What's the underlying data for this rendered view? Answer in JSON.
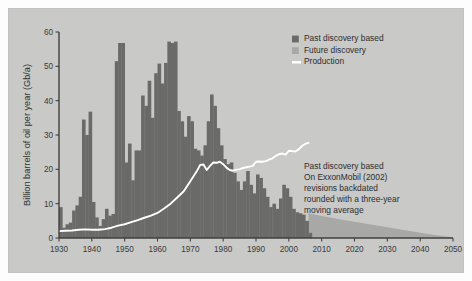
{
  "figure": {
    "panel_background": "#c9c9c7",
    "outer_background": "#fdfdfd"
  },
  "chart_data": {
    "type": "bar",
    "title": "",
    "xlabel": "",
    "ylabel": "Billion barrels of oil per year (Gb/a)",
    "xlim": [
      1930,
      2050
    ],
    "ylim": [
      0,
      60
    ],
    "grid": false,
    "legend_position": "top-right",
    "x_ticks": [
      1930,
      1940,
      1950,
      1960,
      1970,
      1980,
      1990,
      2000,
      2010,
      2020,
      2030,
      2040,
      2050
    ],
    "y_ticks": [
      0,
      10,
      20,
      30,
      40,
      50,
      60
    ],
    "colors": {
      "past_discovery": "#6a6a68",
      "future_discovery": "#a8a8a6",
      "production": "#ffffff"
    },
    "legend": [
      {
        "label": "Past discovery based",
        "color": "#6a6a68",
        "marker": "square"
      },
      {
        "label": "Future discovery",
        "color": "#a8a8a6",
        "marker": "square"
      },
      {
        "label": "Production",
        "color": "#ffffff",
        "marker": "line"
      }
    ],
    "annotation": {
      "lines": [
        "Past discovery based",
        "On ExxonMobil (2002)",
        "revisions backdated",
        "rounded with a three-year",
        "moving average"
      ]
    },
    "series": [
      {
        "name": "Past discovery based",
        "type": "bar",
        "x": [
          1930,
          1931,
          1932,
          1933,
          1934,
          1935,
          1936,
          1937,
          1938,
          1939,
          1940,
          1941,
          1942,
          1943,
          1944,
          1945,
          1946,
          1947,
          1948,
          1949,
          1950,
          1951,
          1952,
          1953,
          1954,
          1955,
          1956,
          1957,
          1958,
          1959,
          1960,
          1961,
          1962,
          1963,
          1964,
          1965,
          1966,
          1967,
          1968,
          1969,
          1970,
          1971,
          1972,
          1973,
          1974,
          1975,
          1976,
          1977,
          1978,
          1979,
          1980,
          1981,
          1982,
          1983,
          1984,
          1985,
          1986,
          1987,
          1988,
          1989,
          1990,
          1991,
          1992,
          1993,
          1994,
          1995,
          1996,
          1997,
          1998,
          1999,
          2000,
          2001,
          2002,
          2003,
          2004,
          2005,
          2006
        ],
        "values": [
          9.0,
          3.0,
          4.0,
          4.5,
          8.0,
          9.5,
          12.0,
          34.5,
          30.0,
          36.8,
          10.5,
          6.0,
          3.5,
          5.5,
          8.5,
          6.5,
          7.0,
          51.5,
          56.8,
          56.8,
          22.0,
          27.5,
          16.8,
          25.5,
          25.5,
          41.5,
          38.5,
          45.8,
          35.0,
          48.0,
          50.8,
          45.0,
          51.0,
          57.2,
          56.8,
          57.2,
          37.0,
          34.0,
          29.5,
          35.5,
          34.0,
          26.0,
          25.5,
          24.0,
          27.0,
          34.0,
          41.8,
          38.5,
          32.0,
          27.0,
          23.0,
          21.5,
          22.0,
          19.0,
          16.5,
          14.0,
          16.5,
          19.5,
          15.5,
          13.0,
          18.5,
          17.5,
          14.5,
          12.0,
          9.0,
          10.0,
          8.5,
          11.5,
          15.5,
          14.5,
          12.0,
          8.5,
          7.5,
          7.2,
          6.8,
          5.0,
          1.5
        ]
      },
      {
        "name": "Future discovery",
        "type": "area",
        "x": [
          2006,
          2010,
          2015,
          2020,
          2025,
          2030,
          2035,
          2040,
          2045,
          2050
        ],
        "values": [
          7.2,
          6.4,
          5.5,
          4.7,
          3.9,
          3.1,
          2.3,
          1.5,
          0.8,
          0.2
        ]
      },
      {
        "name": "Production",
        "type": "line",
        "x": [
          1930,
          1932,
          1934,
          1936,
          1938,
          1940,
          1942,
          1944,
          1946,
          1948,
          1950,
          1952,
          1954,
          1956,
          1958,
          1960,
          1962,
          1964,
          1966,
          1968,
          1970,
          1972,
          1973,
          1974,
          1975,
          1976,
          1977,
          1978,
          1979,
          1980,
          1981,
          1982,
          1983,
          1984,
          1985,
          1986,
          1987,
          1988,
          1989,
          1990,
          1991,
          1992,
          1993,
          1994,
          1995,
          1996,
          1997,
          1998,
          1999,
          2000,
          2001,
          2002,
          2003,
          2004,
          2005,
          2006
        ],
        "values": [
          2.0,
          2.1,
          2.2,
          2.4,
          2.5,
          2.4,
          2.4,
          2.6,
          3.0,
          3.6,
          4.0,
          4.6,
          5.2,
          5.9,
          6.5,
          7.3,
          8.6,
          10.0,
          11.8,
          13.6,
          16.5,
          19.5,
          21.3,
          21.4,
          19.8,
          21.0,
          22.0,
          21.9,
          22.2,
          21.5,
          20.5,
          19.8,
          19.6,
          19.9,
          20.0,
          20.4,
          20.6,
          20.8,
          21.0,
          22.2,
          22.3,
          22.2,
          22.4,
          22.8,
          23.2,
          23.9,
          24.4,
          24.6,
          24.3,
          25.4,
          25.3,
          25.2,
          25.8,
          26.8,
          27.4,
          27.7
        ]
      }
    ]
  }
}
